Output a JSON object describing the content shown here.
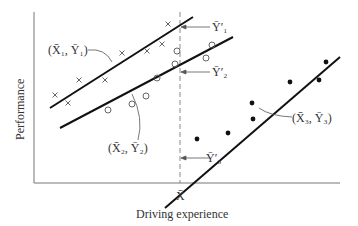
{
  "figure": {
    "xlabel": "Driving experience",
    "ylabel": "Performance",
    "x_tick_label": "X̄",
    "annotations": {
      "group1_mean": "(X̄₁, Ȳ₁)",
      "group2_mean": "(X̄₂, Ȳ₂)",
      "group3_mean": "(X̄₃, Ȳ₃)",
      "adj1": "Ȳ′₁",
      "adj2": "Ȳ′₂",
      "adj3": "Ȳ′₃"
    },
    "groups": [
      {
        "name": "Group 1",
        "marker": "x",
        "points": [
          [
            55,
            95
          ],
          [
            68,
            103
          ],
          [
            79,
            80
          ],
          [
            105,
            80
          ],
          [
            122,
            53
          ],
          [
            147,
            51
          ],
          [
            162,
            44
          ],
          [
            168,
            24
          ]
        ],
        "line": [
          [
            50,
            108
          ],
          [
            193,
            17
          ]
        ]
      },
      {
        "name": "Group 2",
        "marker": "o",
        "points": [
          [
            108,
            110
          ],
          [
            132,
            104
          ],
          [
            146,
            96
          ],
          [
            157,
            78
          ],
          [
            175,
            64
          ],
          [
            177,
            51
          ],
          [
            212,
            45
          ],
          [
            206,
            58
          ]
        ],
        "line": [
          [
            60,
            128
          ],
          [
            233,
            37
          ]
        ]
      },
      {
        "name": "Group 3",
        "marker": "dot",
        "points": [
          [
            197,
            139
          ],
          [
            228,
            133
          ],
          [
            252,
            103
          ],
          [
            253,
            119
          ],
          [
            290,
            82
          ],
          [
            319,
            80
          ],
          [
            326,
            62
          ]
        ],
        "line": [
          [
            165,
            208
          ],
          [
            340,
            57
          ]
        ]
      }
    ]
  }
}
